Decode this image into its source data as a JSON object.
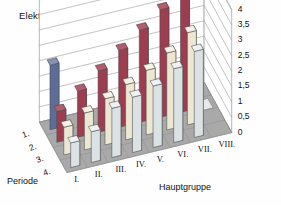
{
  "chart": {
    "title": "Elektronegativität",
    "axis_title_depth": "Periode",
    "axis_title_horizontal": "Hauptgruppe",
    "yticks": [
      "0",
      "0,5",
      "1",
      "1,5",
      "2",
      "2,5",
      "3",
      "3,5",
      "4"
    ],
    "group_labels": [
      "I.",
      "II.",
      "III.",
      "IV.",
      "V.",
      "VI.",
      "VII.",
      "VIII."
    ],
    "period_labels": [
      "1.",
      "2.",
      "3.",
      "4."
    ]
  },
  "colors": {
    "period1": "#5d6d95",
    "period1_side": "#495879",
    "period1_top": "#8392b5",
    "period2": "#9d3e50",
    "period2_side": "#7e2f3f",
    "period2_top": "#b45c6c",
    "period3": "#ece7d2",
    "period3_side": "#cfc9b2",
    "period3_top": "#f6f3e6",
    "period4": "#dbe2e4",
    "period4_side": "#bcc5c8",
    "period4_top": "#eef2f3",
    "floor": "#a9a9a9",
    "wall": "#ffffff",
    "grid": "#9a9a9a",
    "outline": "#4a4a4a"
  },
  "chart_data": {
    "type": "bar",
    "title": "Elektronegativität",
    "xlabel": "Hauptgruppe",
    "zlabel": "Periode",
    "ylabel": "Elektronegativität",
    "ylim": [
      0,
      4
    ],
    "ytick_step": 0.5,
    "grid": true,
    "legend": "none",
    "categories": [
      "I.",
      "II.",
      "III.",
      "IV.",
      "V.",
      "VI.",
      "VII.",
      "VIII."
    ],
    "series": [
      {
        "name": "1.",
        "color": "#5d6d95",
        "values": [
          2.1,
          null,
          null,
          null,
          null,
          null,
          null,
          null
        ]
      },
      {
        "name": "2.",
        "color": "#9d3e50",
        "values": [
          1.0,
          1.5,
          2.0,
          2.5,
          3.0,
          3.5,
          4.0,
          null
        ]
      },
      {
        "name": "3.",
        "color": "#ece7d2",
        "values": [
          0.9,
          1.2,
          1.5,
          1.8,
          2.1,
          2.5,
          3.0,
          null
        ]
      },
      {
        "name": "4.",
        "color": "#dbe2e4",
        "values": [
          0.8,
          1.0,
          1.6,
          1.8,
          2.0,
          2.4,
          2.8,
          null
        ]
      }
    ]
  }
}
